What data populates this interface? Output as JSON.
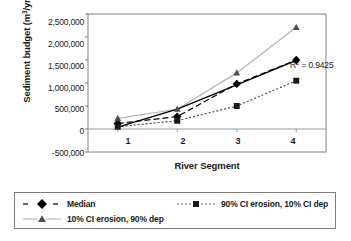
{
  "chart_data": {
    "type": "line",
    "title": "",
    "xlabel": "River Segment",
    "ylabel": "Sediment budget (m3/yr)",
    "ylabel_html": "Sediment budget (m<sup>3</sup>/yr)",
    "categories": [
      "1",
      "2",
      "3",
      "4"
    ],
    "x": [
      1,
      2,
      3,
      4
    ],
    "ylim": [
      -500000,
      2500000
    ],
    "yticks": [
      2500000,
      2000000,
      1500000,
      1000000,
      500000,
      0,
      -500000
    ],
    "ytick_labels": [
      "2,500,000",
      "2,000,000",
      "1,500,000",
      "1,000,000",
      "500,000",
      "0",
      "-500,000"
    ],
    "xtick_labels": [
      "1",
      "2",
      "3",
      "4"
    ],
    "grid": false,
    "legend_position": "bottom",
    "annotations": [
      {
        "text": "R2 = 0.9425",
        "text_html": "R<sup>2</sup> = 0.9425",
        "x": 4,
        "y": 1500000
      }
    ],
    "series": [
      {
        "name": "Median",
        "marker": "diamond",
        "linestyle": "dashed",
        "color": "#000000",
        "values": [
          120000,
          270000,
          980000,
          1500000
        ]
      },
      {
        "name": "90% CI erosion, 10% CI dep",
        "marker": "square",
        "linestyle": "dotted",
        "color": "#4d4d4d",
        "values": [
          50000,
          180000,
          500000,
          1050000
        ]
      },
      {
        "name": "10% CI erosion, 90% dep",
        "marker": "triangle",
        "linestyle": "solid",
        "color": "#b3b3b3",
        "values": [
          230000,
          430000,
          1220000,
          2210000
        ]
      },
      {
        "name": "trendline",
        "marker": "none",
        "linestyle": "solid",
        "color": "#000000",
        "values": [
          40000,
          430000,
          960000,
          1490000
        ]
      }
    ]
  },
  "legend": {
    "entries": [
      {
        "label": "Median",
        "marker": "diamond"
      },
      {
        "label": "90% CI erosion, 10% CI dep",
        "marker": "square"
      },
      {
        "label": "10% CI erosion, 90% dep",
        "marker": "triangle"
      }
    ]
  }
}
